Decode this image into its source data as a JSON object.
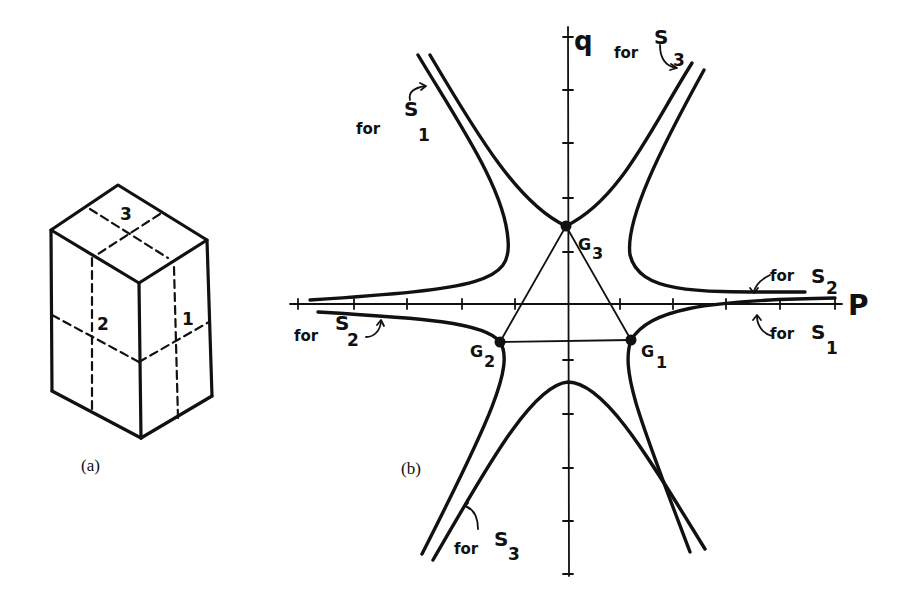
{
  "figure_a": {
    "caption": "(a)",
    "face_labels": {
      "top": "3",
      "left": "2",
      "right": "1"
    }
  },
  "figure_b": {
    "caption": "(b)",
    "axes": {
      "x_label": "P",
      "y_label": "q"
    },
    "points": {
      "g1": "G",
      "g1_sub": "1",
      "g2": "G",
      "g2_sub": "2",
      "g3": "G",
      "g3_sub": "3"
    },
    "annotations": {
      "for_word": "for",
      "s_letter": "S",
      "upper_left_sub": "1",
      "upper_right_sub": "3",
      "right_upper_sub": "2",
      "right_lower_sub": "1",
      "left_lower_sub": "2",
      "bottom_left_sub": "3"
    }
  },
  "colors": {
    "ink": "#111111",
    "background": "#ffffff"
  }
}
